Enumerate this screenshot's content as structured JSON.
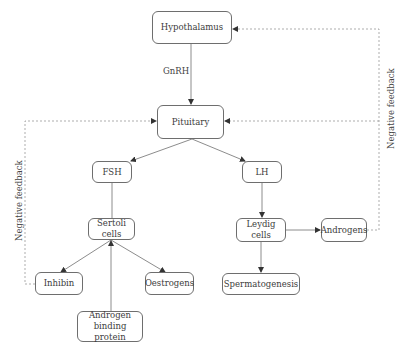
{
  "diagram": {
    "nodes": {
      "hypothalamus": "Hypothalamus",
      "pituitary": "Pituitary",
      "fsh": "FSH",
      "lh": "LH",
      "sertoli": "Sertoli cells",
      "leydig": "Leydig cells",
      "androgens": "Androgens",
      "inhibin": "Inhibin",
      "oestrogens": "Oestrogens",
      "spermatogenesis": "Spermatogenesis",
      "abp_line1": "Androgen",
      "abp_line2": "binding protein"
    },
    "edge_labels": {
      "gnrh": "GnRH",
      "neg_feedback_left": "Negative feedback",
      "neg_feedback_right": "Negative feedback"
    },
    "edges": [
      {
        "from": "Hypothalamus",
        "to": "Pituitary",
        "label": "GnRH",
        "style": "solid"
      },
      {
        "from": "Pituitary",
        "to": "FSH",
        "style": "solid"
      },
      {
        "from": "Pituitary",
        "to": "LH",
        "style": "solid"
      },
      {
        "from": "FSH",
        "to": "Sertoli cells",
        "style": "solid"
      },
      {
        "from": "LH",
        "to": "Leydig cells",
        "style": "solid"
      },
      {
        "from": "Sertoli cells",
        "to": "Inhibin",
        "style": "solid"
      },
      {
        "from": "Sertoli cells",
        "to": "Oestrogens",
        "style": "solid"
      },
      {
        "from": "Androgen binding protein",
        "to": "Sertoli cells",
        "style": "solid"
      },
      {
        "from": "Leydig cells",
        "to": "Androgens",
        "style": "solid"
      },
      {
        "from": "Leydig cells",
        "to": "Spermatogenesis",
        "style": "solid"
      },
      {
        "from": "Inhibin",
        "to": "Pituitary",
        "label": "Negative feedback",
        "style": "dashed"
      },
      {
        "from": "Androgens",
        "to": "Hypothalamus",
        "label": "Negative feedback",
        "style": "dashed"
      },
      {
        "from": "Androgens",
        "to": "Pituitary",
        "label": "Negative feedback",
        "style": "dashed"
      }
    ],
    "colors": {
      "line": "#6e6e6e",
      "dashed": "#8a8a8a",
      "text": "#3c3c3c"
    }
  }
}
